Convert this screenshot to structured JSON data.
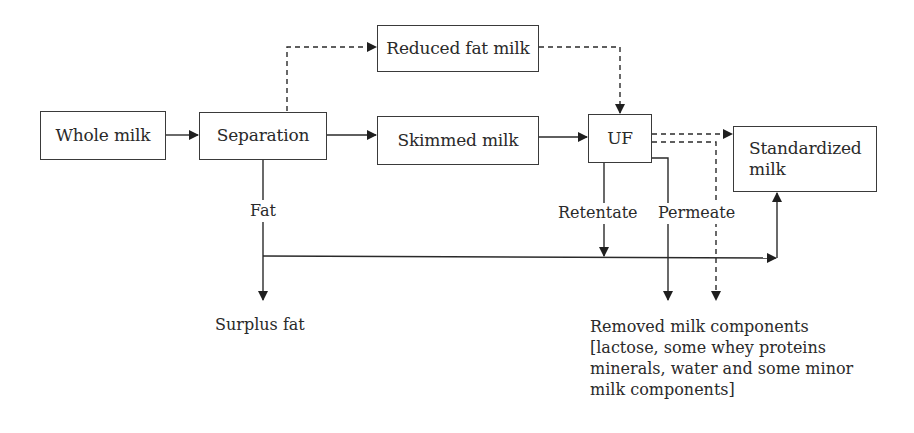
{
  "diagram": {
    "type": "process-flow",
    "nodes": {
      "whole_milk": "Whole milk",
      "separation": "Separation",
      "reduced_fat_milk": "Reduced fat milk",
      "skimmed_milk": "Skimmed milk",
      "uf": "UF",
      "standardized_milk_line1": "Standardized",
      "standardized_milk_line2": "milk"
    },
    "labels": {
      "fat": "Fat",
      "retentate": "Retentate",
      "permeate": "Permeate",
      "surplus_fat": "Surplus fat",
      "removed_line1": "Removed milk components",
      "removed_line2": "[lactose, some whey proteins",
      "removed_line3": "minerals, water and some minor",
      "removed_line4": "milk components]"
    },
    "edges": [
      {
        "from": "Whole milk",
        "to": "Separation",
        "style": "solid"
      },
      {
        "from": "Separation",
        "to": "Skimmed milk",
        "style": "solid"
      },
      {
        "from": "Separation",
        "to": "Reduced fat milk",
        "style": "dashed"
      },
      {
        "from": "Reduced fat milk",
        "to": "UF",
        "style": "dashed"
      },
      {
        "from": "Skimmed milk",
        "to": "UF",
        "style": "solid"
      },
      {
        "from": "UF",
        "to": "Standardized milk",
        "style": "dashed"
      },
      {
        "from": "UF",
        "to": "Removed milk components",
        "style": "dashed"
      },
      {
        "from": "Separation",
        "to": "Surplus fat",
        "label": "Fat",
        "style": "solid"
      },
      {
        "from": "Fat",
        "to": "Standardized milk",
        "style": "solid"
      },
      {
        "from": "UF",
        "to": "Fat line",
        "label": "Retentate",
        "style": "solid"
      },
      {
        "from": "UF",
        "to": "Removed milk components",
        "label": "Permeate",
        "style": "solid"
      }
    ],
    "colors": {
      "line": "#2a2a2a",
      "box_border": "#3a3a3a",
      "background": "#ffffff"
    }
  }
}
